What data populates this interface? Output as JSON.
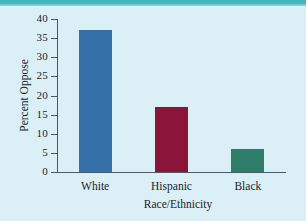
{
  "chart_data": {
    "type": "bar",
    "title": "",
    "categories": [
      "White",
      "Hispanic",
      "Black"
    ],
    "values": [
      37,
      17,
      6
    ],
    "xlabel": "Race/Ethnicity",
    "ylabel": "Percent Oppose",
    "ylim": [
      0,
      40
    ],
    "yticks": [
      0,
      5,
      10,
      15,
      20,
      25,
      30,
      35,
      40
    ],
    "ytick_labels": [
      "0",
      "5",
      "10",
      "15",
      "20",
      "25",
      "30",
      "35",
      "40"
    ],
    "grid": false,
    "legend": "none",
    "bar_colors": [
      "#3570a8",
      "#8b1538",
      "#2e7d6b"
    ]
  },
  "figure": {
    "background_color": "#dbf0f6",
    "accent_rule_color": "#46b7bd",
    "axis_color": "#4a5a62",
    "text_color": "#1b2328"
  }
}
